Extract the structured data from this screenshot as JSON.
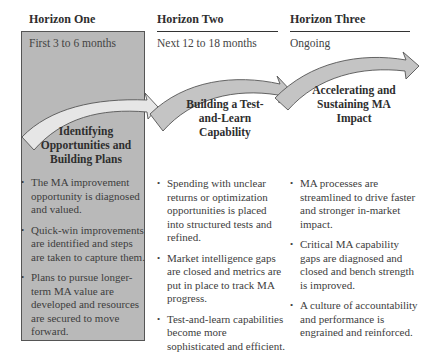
{
  "columns": [
    {
      "header": "Horizon One",
      "timeframe": "First 3 to 6 months",
      "phase_title": "Identifying Opportunities and Building Plans",
      "bullets": [
        "The MA improvement opportunity is diagnosed and valued.",
        "Quick-win improvements are identified and steps are taken to capture them.",
        "Plans to pursue longer-term MA value are developed and resources are secured to move forward."
      ]
    },
    {
      "header": "Horizon Two",
      "timeframe": "Next 12 to 18 months",
      "phase_title": "Building a Test-and-Learn Capability",
      "bullets": [
        "Spending with unclear returns or optimization opportunities is placed into structured tests and refined.",
        "Market intelligence gaps are closed and metrics are put in place to track MA progress.",
        "Test-and-learn capabilities become more sophisticated and efficient."
      ]
    },
    {
      "header": "Horizon Three",
      "timeframe": "Ongoing",
      "phase_title": "Accelerating and Sustaining MA Impact",
      "bullets": [
        "MA processes are streamlined to drive faster and stronger in-market impact.",
        "Critical MA capability gaps are diagnosed and closed and bench strength is improved.",
        "A culture of accountability and performance is engrained and reinforced."
      ]
    }
  ],
  "colors": {
    "highlight_box": "#b9b9b9",
    "arrow_fill_light": "#e6e6e6",
    "arrow_fill": "#c4c4c4",
    "arrow_stroke": "#555555",
    "rule": "#333333"
  }
}
